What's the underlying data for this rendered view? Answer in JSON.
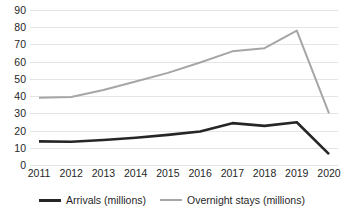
{
  "chart_data": {
    "type": "line",
    "title": "",
    "subtitle": "",
    "xlabel": "",
    "ylabel": "",
    "categories": [
      "2011",
      "2012",
      "2013",
      "2014",
      "2015",
      "2016",
      "2017",
      "2018",
      "2019",
      "2020"
    ],
    "series": [
      {
        "name": "Arrivals (millions)",
        "color": "#262626",
        "values": [
          13.7,
          13.5,
          14.5,
          15.8,
          17.5,
          19.5,
          24.3,
          22.7,
          24.8,
          6.3
        ]
      },
      {
        "name": "Overnight stays (millions)",
        "color": "#a6a6a6",
        "values": [
          39.0,
          39.5,
          43.5,
          48.5,
          53.5,
          59.5,
          66.0,
          67.8,
          78.0,
          30.0
        ]
      }
    ],
    "ylim": [
      0,
      90
    ],
    "ytick_labels": [
      "90",
      "80",
      "70",
      "60",
      "50",
      "40",
      "30",
      "20",
      "10",
      "0"
    ],
    "ytick_values": [
      90,
      80,
      70,
      60,
      50,
      40,
      30,
      20,
      10,
      0
    ],
    "xlim_labels": [
      "2011",
      "2020"
    ],
    "grid": true,
    "grid_color": "#e4e4e4",
    "legend_position": "bottom"
  },
  "legend": {
    "entries": [
      {
        "label": "Arrivals (millions)"
      },
      {
        "label": "Overnight stays (millions)"
      }
    ]
  }
}
